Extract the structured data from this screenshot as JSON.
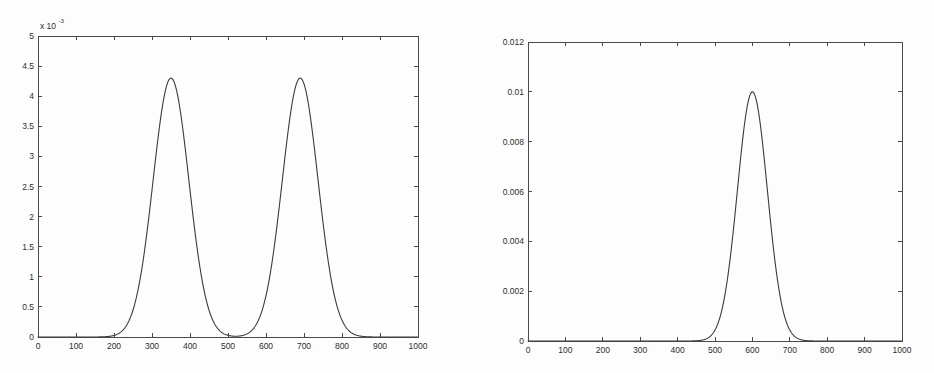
{
  "page": {
    "background_color": "#fdfdfd",
    "axis_color": "#4a4a4a",
    "curve_color": "#3b3b3b"
  },
  "chart_data": [
    {
      "id": "left",
      "type": "line",
      "title": "",
      "subtitle": "",
      "xlabel": "",
      "ylabel": "",
      "y_exponent_label": "x 10",
      "y_exponent_power": "-3",
      "xlim": [
        0,
        1000
      ],
      "ylim": [
        0,
        0.005
      ],
      "grid": false,
      "legend": null,
      "box": true,
      "ticks_all_sides": true,
      "xticks": [
        0,
        100,
        200,
        300,
        400,
        500,
        600,
        700,
        800,
        900,
        1000
      ],
      "xticklabels": [
        "0",
        "100",
        "200",
        "300",
        "400",
        "500",
        "600",
        "700",
        "800",
        "900",
        "1000"
      ],
      "yticks": [
        0,
        0.0005,
        0.001,
        0.0015,
        0.002,
        0.0025,
        0.003,
        0.0035,
        0.004,
        0.0045,
        0.005
      ],
      "yticklabels": [
        "0",
        "0.5",
        "1",
        "1.5",
        "2",
        "2.5",
        "3",
        "3.5",
        "4",
        "4.5",
        "5"
      ],
      "annotations": [],
      "series": [
        {
          "name": "bimodal density",
          "description": "Mixture of two Gaussian modes",
          "peaks": [
            {
              "x": 350,
              "y": 0.0043
            },
            {
              "x": 690,
              "y": 0.0043
            }
          ],
          "valley": {
            "x": 520,
            "y": 0.00048
          },
          "model": {
            "kind": "gaussian-mixture",
            "components": [
              {
                "mu": 350,
                "sigma": 47,
                "weight": 0.5
              },
              {
                "mu": 690,
                "sigma": 47,
                "weight": 0.5
              }
            ],
            "peak_value": 0.0043
          },
          "x": [
            0,
            50,
            100,
            150,
            180,
            200,
            220,
            230,
            240,
            250,
            260,
            270,
            280,
            290,
            300,
            310,
            320,
            330,
            340,
            350,
            360,
            370,
            380,
            390,
            400,
            410,
            420,
            430,
            440,
            450,
            460,
            470,
            480,
            490,
            500,
            510,
            520,
            530,
            540,
            550,
            560,
            570,
            580,
            590,
            600,
            610,
            620,
            630,
            640,
            650,
            660,
            670,
            680,
            690,
            700,
            710,
            720,
            730,
            740,
            750,
            760,
            770,
            780,
            790,
            800,
            810,
            820,
            850,
            900,
            950,
            1000
          ],
          "y": [
            0.0,
            0.0,
            0.0,
            0.0,
            1e-05,
            3e-05,
            9e-05,
            0.00014,
            0.00022,
            0.00033,
            0.0005,
            0.00074,
            0.00106,
            0.00147,
            0.00198,
            0.00256,
            0.00316,
            0.00372,
            0.00416,
            0.0043,
            0.00416,
            0.00373,
            0.00319,
            0.00261,
            0.00207,
            0.00161,
            0.00124,
            0.00097,
            0.00078,
            0.00065,
            0.00057,
            0.00052,
            0.00049,
            0.00048,
            0.00048,
            0.00048,
            0.00048,
            0.00049,
            0.00052,
            0.00058,
            0.00068,
            0.00084,
            0.00108,
            0.00142,
            0.00187,
            0.00243,
            0.00304,
            0.00362,
            0.00408,
            0.0043,
            0.00425,
            0.00393,
            0.00342,
            0.0043,
            0.00342,
            0.00276,
            0.00211,
            0.00154,
            0.00106,
            0.0007,
            0.00044,
            0.00026,
            0.00015,
            8e-05,
            4e-05,
            2e-05,
            1e-05,
            0.0,
            0.0,
            0.0,
            0.0
          ]
        }
      ]
    },
    {
      "id": "right",
      "type": "line",
      "title": "",
      "subtitle": "",
      "xlabel": "",
      "ylabel": "",
      "y_exponent_label": "",
      "y_exponent_power": "",
      "xlim": [
        0,
        1000
      ],
      "ylim": [
        0,
        0.012
      ],
      "grid": false,
      "legend": null,
      "box": true,
      "ticks_all_sides": true,
      "xticks": [
        0,
        100,
        200,
        300,
        400,
        500,
        600,
        700,
        800,
        900,
        1000
      ],
      "xticklabels": [
        "0",
        "100",
        "200",
        "300",
        "400",
        "500",
        "600",
        "700",
        "800",
        "900",
        "1000"
      ],
      "yticks": [
        0,
        0.002,
        0.004,
        0.006,
        0.008,
        0.01,
        0.012
      ],
      "yticklabels": [
        "0",
        "0.002",
        "0.004",
        "0.006",
        "0.008",
        "0.01",
        "0.012"
      ],
      "annotations": [],
      "series": [
        {
          "name": "unimodal density",
          "description": "Single Gaussian mode",
          "peaks": [
            {
              "x": 600,
              "y": 0.01
            }
          ],
          "valley": null,
          "model": {
            "kind": "gaussian",
            "components": [
              {
                "mu": 600,
                "sigma": 40,
                "weight": 1.0
              }
            ],
            "peak_value": 0.01
          },
          "x": [
            0,
            100,
            200,
            300,
            380,
            420,
            440,
            460,
            470,
            480,
            490,
            500,
            510,
            520,
            530,
            540,
            550,
            560,
            570,
            580,
            590,
            600,
            610,
            620,
            630,
            640,
            650,
            660,
            670,
            680,
            690,
            700,
            710,
            720,
            730,
            740,
            760,
            800,
            900,
            1000
          ],
          "y": [
            0.0,
            0.0,
            0.0,
            0.0,
            0.0,
            2e-05,
            5e-05,
            0.00011,
            0.00018,
            0.00029,
            0.00044,
            0.00066,
            0.00097,
            0.00137,
            0.00191,
            0.00259,
            0.00342,
            0.00438,
            0.00544,
            0.00654,
            0.00761,
            0.00855,
            0.0093,
            0.00978,
            0.00996,
            0.00983,
            0.0094,
            0.00871,
            0.00783,
            0.00682,
            0.00577,
            0.00473,
            0.00376,
            0.0029,
            0.00217,
            0.00157,
            0.00073,
            0.0001,
            0.0,
            0.0
          ]
        }
      ]
    }
  ]
}
